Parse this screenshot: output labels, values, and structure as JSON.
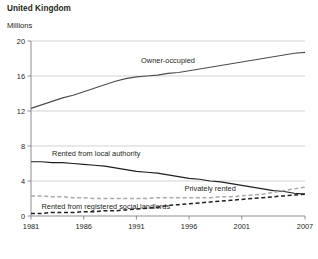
{
  "chart": {
    "title": "United Kingdom",
    "subtitle": "Millions"
  },
  "chart_data": {
    "type": "line",
    "title": "United Kingdom",
    "subtitle": "Millions",
    "xlabel": "",
    "ylabel": "Millions",
    "xlim": [
      1981,
      2007
    ],
    "ylim": [
      0,
      20
    ],
    "yticks": [
      0,
      4,
      8,
      12,
      16,
      20
    ],
    "xticks": [
      1981,
      1986,
      1991,
      1996,
      2001,
      2007
    ],
    "grid": "horizontal",
    "legend": "inline-annotations",
    "x": [
      1981,
      1982,
      1983,
      1984,
      1985,
      1986,
      1987,
      1988,
      1989,
      1990,
      1991,
      1992,
      1993,
      1994,
      1995,
      1996,
      1997,
      1998,
      1999,
      2000,
      2001,
      2002,
      2003,
      2004,
      2005,
      2006,
      2007
    ],
    "series": [
      {
        "name": "Owner-occupied",
        "style": "solid",
        "color": "#4d4d4d",
        "values": [
          12.3,
          12.7,
          13.1,
          13.5,
          13.8,
          14.2,
          14.6,
          15.0,
          15.4,
          15.7,
          15.9,
          16.0,
          16.1,
          16.3,
          16.4,
          16.6,
          16.8,
          17.0,
          17.2,
          17.4,
          17.6,
          17.8,
          18.0,
          18.2,
          18.4,
          18.6,
          18.7
        ]
      },
      {
        "name": "Rented from local authority",
        "style": "solid",
        "color": "#231f20",
        "values": [
          6.2,
          6.2,
          6.1,
          6.1,
          6.0,
          5.9,
          5.8,
          5.7,
          5.5,
          5.3,
          5.1,
          5.0,
          4.9,
          4.7,
          4.5,
          4.3,
          4.2,
          4.0,
          3.9,
          3.7,
          3.5,
          3.3,
          3.1,
          2.9,
          2.8,
          2.6,
          2.5
        ]
      },
      {
        "name": "Privately rented",
        "style": "dashed",
        "color": "#a7a9ac",
        "values": [
          2.3,
          2.3,
          2.2,
          2.2,
          2.1,
          2.1,
          2.0,
          2.0,
          2.0,
          2.0,
          2.0,
          2.0,
          2.1,
          2.1,
          2.1,
          2.1,
          2.1,
          2.1,
          2.2,
          2.2,
          2.3,
          2.4,
          2.5,
          2.7,
          2.9,
          3.1,
          3.3
        ]
      },
      {
        "name": "Rented from registered social landlords",
        "style": "dashed",
        "color": "#231f20",
        "values": [
          0.3,
          0.3,
          0.4,
          0.4,
          0.4,
          0.5,
          0.5,
          0.6,
          0.6,
          0.7,
          0.8,
          0.9,
          1.0,
          1.2,
          1.3,
          1.4,
          1.5,
          1.6,
          1.7,
          1.8,
          1.9,
          2.0,
          2.1,
          2.2,
          2.3,
          2.4,
          2.5
        ]
      }
    ],
    "annotations": [
      {
        "text": "Owner-occupied",
        "x": 1994,
        "y": 17.8
      },
      {
        "text": "Rented from local authority",
        "x": 1983,
        "y": 7.2
      },
      {
        "text": "Privately rented",
        "x": 1998,
        "y": 3.2
      },
      {
        "text": "Rented from registered social landlords",
        "x": 1982,
        "y": 1.05
      }
    ]
  }
}
